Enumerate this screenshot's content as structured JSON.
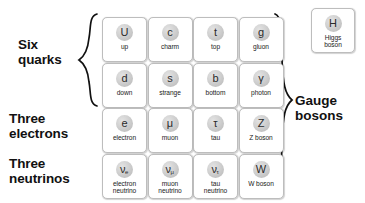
{
  "diagram": {
    "group_labels": {
      "quarks": "Six\nquarks",
      "electrons": "Three\nelectrons",
      "neutrinos": "Three\nneutrinos",
      "gauge_bosons": "Gauge\nbosons"
    },
    "colors": {
      "text": "#111111",
      "card_border": "#bdbdbd",
      "card_background": "#ffffff",
      "disc_fill": "#cfcfcf",
      "page_background": "#ffffff"
    },
    "rows": [
      {
        "row_name": "quarks-up-type-and-gluon",
        "cards": [
          {
            "symbol": "U",
            "subscript": "",
            "label": "up"
          },
          {
            "symbol": "c",
            "subscript": "",
            "label": "charm"
          },
          {
            "symbol": "t",
            "subscript": "",
            "label": "top"
          },
          {
            "symbol": "g",
            "subscript": "",
            "label": "gluon"
          }
        ]
      },
      {
        "row_name": "quarks-down-type-and-photon",
        "cards": [
          {
            "symbol": "d",
            "subscript": "",
            "label": "down"
          },
          {
            "symbol": "s",
            "subscript": "",
            "label": "strange"
          },
          {
            "symbol": "b",
            "subscript": "",
            "label": "bottom"
          },
          {
            "symbol": "γ",
            "subscript": "",
            "label": "photon"
          }
        ]
      },
      {
        "row_name": "charged-leptons-and-z-boson",
        "cards": [
          {
            "symbol": "e",
            "subscript": "",
            "label": "electron"
          },
          {
            "symbol": "μ",
            "subscript": "",
            "label": "muon"
          },
          {
            "symbol": "τ",
            "subscript": "",
            "label": "tau"
          },
          {
            "symbol": "Z",
            "subscript": "",
            "label": "Z boson"
          }
        ]
      },
      {
        "row_name": "neutrinos-and-w-boson",
        "cards": [
          {
            "symbol": "ν",
            "subscript": "e",
            "label": "electron\nneutrino"
          },
          {
            "symbol": "ν",
            "subscript": "μ",
            "label": "muon\nneutrino"
          },
          {
            "symbol": "ν",
            "subscript": "τ",
            "label": "tau\nneutrino"
          },
          {
            "symbol": "W",
            "subscript": "",
            "label": "W boson"
          }
        ]
      }
    ],
    "higgs": {
      "symbol": "H",
      "subscript": "",
      "label": "Higgs\nboson"
    }
  }
}
